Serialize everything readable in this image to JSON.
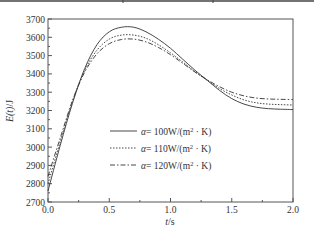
{
  "chart_data": {
    "type": "line",
    "title": "",
    "xlabel": "t/s",
    "ylabel": "E(t)/J",
    "xlim": [
      0.0,
      2.0
    ],
    "ylim": [
      2700,
      3700
    ],
    "xticks": [
      "0.0",
      "0.5",
      "1.0",
      "1.5",
      "2.0"
    ],
    "yticks": [
      "2700",
      "2800",
      "2900",
      "3000",
      "3100",
      "3200",
      "3300",
      "3400",
      "3500",
      "3600",
      "3700"
    ],
    "grid": false,
    "legend_position": "center-left inside plot",
    "x": [
      0.0,
      0.1,
      0.2,
      0.3,
      0.4,
      0.5,
      0.6,
      0.7,
      0.8,
      0.9,
      1.0,
      1.1,
      1.2,
      1.3,
      1.4,
      1.5,
      1.6,
      1.7,
      1.8,
      1.9,
      2.0
    ],
    "series": [
      {
        "name": "α=100W/(m²·K)",
        "label_parts": {
          "symbol": "α",
          "rest": "= 100W/(m",
          "sup": "2",
          "tail": " · K)"
        },
        "style": "solid",
        "values": [
          2760,
          3010,
          3240,
          3430,
          3560,
          3630,
          3655,
          3655,
          3630,
          3590,
          3540,
          3480,
          3420,
          3365,
          3310,
          3265,
          3235,
          3218,
          3210,
          3207,
          3205
        ]
      },
      {
        "name": "α=110W/(m²·K)",
        "label_parts": {
          "symbol": "α",
          "rest": "= 110W/(m",
          "sup": "2",
          "tail": " · K)"
        },
        "style": "dotted",
        "values": [
          2800,
          3030,
          3250,
          3420,
          3530,
          3590,
          3612,
          3612,
          3595,
          3560,
          3515,
          3465,
          3412,
          3365,
          3320,
          3285,
          3258,
          3242,
          3235,
          3232,
          3230
        ]
      },
      {
        "name": "α=120W/(m²·K)",
        "label_parts": {
          "symbol": "α",
          "rest": "= 120W/(m",
          "sup": "2",
          "tail": " · K)"
        },
        "style": "dash-dot",
        "values": [
          2840,
          3050,
          3255,
          3410,
          3510,
          3565,
          3588,
          3590,
          3575,
          3545,
          3505,
          3458,
          3410,
          3368,
          3330,
          3300,
          3280,
          3268,
          3263,
          3261,
          3260
        ]
      }
    ]
  },
  "colors": {
    "line": "#333333",
    "axis": "#555555",
    "background": "#ffffff"
  }
}
